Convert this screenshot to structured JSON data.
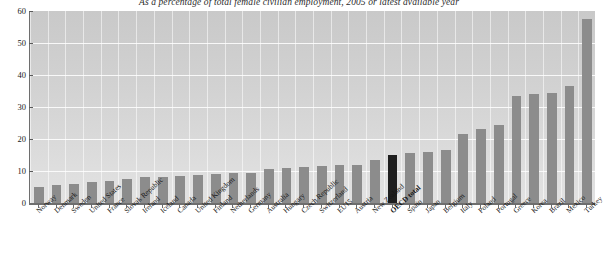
{
  "chart_title": "As a percentage of total female civilian employment, 2005 or latest available year",
  "axis": {
    "y_ticks": [
      "0",
      "10",
      "20",
      "30",
      "40",
      "50",
      "60"
    ],
    "y_min": 0,
    "y_max": 60,
    "highlight_color": "#1e1e1e",
    "bar_color": "#8c8c8c"
  },
  "chart_data": {
    "type": "bar",
    "title": "As a percentage of total female civilian employment, 2005 or latest available year",
    "xlabel": "",
    "ylabel": "",
    "ylim": [
      0,
      60
    ],
    "ytick_step": 10,
    "grid": true,
    "legend": "none",
    "highlight_category": "OECD total",
    "categories": [
      "Norway",
      "Denmark",
      "Sweden",
      "United States",
      "France",
      "Slovak Republic",
      "Ireland",
      "Iceland",
      "Canada",
      "United Kingdom",
      "Finland",
      "Netherlands",
      "Germany",
      "Australia",
      "Hungary",
      "Czech Republic",
      "Switzerland",
      "EU15",
      "Austria",
      "New Zealand",
      "OECD total",
      "Spain",
      "Japan",
      "Belgium",
      "Italy",
      "Poland",
      "Portugal",
      "Greece",
      "Korea",
      "Brazil",
      "Mexico",
      "Turkey"
    ],
    "values": [
      5.0,
      5.5,
      6.0,
      6.5,
      7.0,
      7.5,
      8.0,
      8.2,
      8.5,
      8.8,
      9.0,
      9.3,
      9.5,
      10.5,
      11.0,
      11.2,
      11.5,
      11.8,
      12.0,
      13.5,
      15.0,
      15.5,
      16.0,
      16.5,
      21.5,
      23.0,
      24.5,
      33.5,
      34.0,
      34.5,
      36.5,
      57.5
    ]
  }
}
